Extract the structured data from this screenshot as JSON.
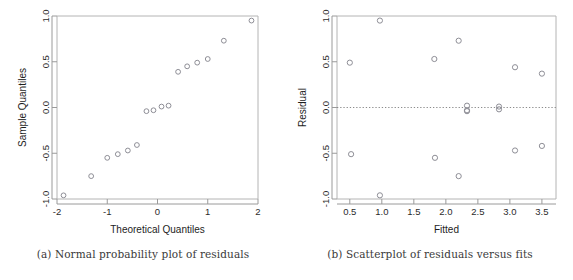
{
  "figure": {
    "panels": [
      {
        "id": "panel-a",
        "caption": "(a) Normal probability plot of residuals",
        "caption_letter": "(a)"
      },
      {
        "id": "panel-b",
        "caption": "(b) Scatterplot of residuals versus fits",
        "caption_letter": "(b)"
      }
    ]
  },
  "chart_data": [
    {
      "type": "scatter",
      "panel": "a",
      "title": "",
      "xlabel": "Theoretical Quantiles",
      "ylabel": "Sample Quantiles",
      "xlim": [
        -2.1,
        2.1
      ],
      "ylim": [
        -1.08,
        1.08
      ],
      "xticks": [
        -2,
        -1,
        0,
        1,
        2
      ],
      "xticklabels": [
        "-2",
        "-1",
        "0",
        "1",
        "2"
      ],
      "yticks": [
        -1.0,
        -0.5,
        0.0,
        0.5,
        1.0
      ],
      "yticklabels": [
        "-1.0",
        "-0.5",
        "0.0",
        "0.5",
        "1.0"
      ],
      "grid": false,
      "legend": null,
      "marker": "open-circle",
      "x": [
        -1.87,
        -1.32,
        -1.0,
        -0.79,
        -0.59,
        -0.41,
        -0.22,
        -0.08,
        0.08,
        0.22,
        0.41,
        0.59,
        0.79,
        1.0,
        1.32,
        1.87
      ],
      "y": [
        -0.96,
        -0.75,
        -0.55,
        -0.51,
        -0.47,
        -0.41,
        -0.04,
        -0.03,
        0.01,
        0.02,
        0.39,
        0.45,
        0.49,
        0.53,
        0.73,
        0.95
      ]
    },
    {
      "type": "scatter",
      "panel": "b",
      "title": "",
      "xlabel": "Fitted",
      "ylabel": "Residual",
      "xlim": [
        0.3,
        3.72
      ],
      "ylim": [
        -1.08,
        1.08
      ],
      "xticks": [
        0.5,
        1.0,
        1.5,
        2.0,
        2.5,
        3.0,
        3.5
      ],
      "xticklabels": [
        "0.5",
        "1.0",
        "1.5",
        "2.0",
        "2.5",
        "3.0",
        "3.5"
      ],
      "yticks": [
        -1.0,
        -0.5,
        0.0,
        0.5,
        1.0
      ],
      "yticklabels": [
        "-1.0",
        "-0.5",
        "0.0",
        "0.5",
        "1.0"
      ],
      "grid": false,
      "legend": null,
      "marker": "open-circle",
      "reference_line": {
        "orientation": "horizontal",
        "value": 0.0,
        "style": "dotted"
      },
      "x": [
        0.5,
        0.52,
        0.97,
        0.97,
        1.82,
        1.83,
        2.2,
        2.2,
        2.33,
        2.33,
        2.33,
        2.83,
        2.83,
        3.08,
        3.08,
        3.5,
        3.5
      ],
      "y": [
        0.49,
        -0.51,
        0.95,
        -0.96,
        0.53,
        -0.55,
        0.73,
        -0.75,
        0.02,
        -0.03,
        -0.04,
        0.01,
        -0.02,
        0.44,
        -0.47,
        0.37,
        -0.42
      ]
    }
  ]
}
